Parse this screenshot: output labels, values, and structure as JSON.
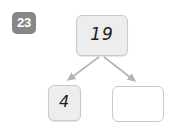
{
  "exercise": {
    "type": "number-bond",
    "question_number": "23",
    "whole": {
      "value": "19",
      "filled": true
    },
    "parts": [
      {
        "name": "left-part",
        "value": "4",
        "filled": true
      },
      {
        "name": "right-part",
        "value": "",
        "filled": false,
        "placeholder": ""
      }
    ],
    "arrows": [
      {
        "name": "arrow-to-left-part",
        "from": "whole",
        "to": "left-part"
      },
      {
        "name": "arrow-to-right-part",
        "from": "whole",
        "to": "right-part"
      }
    ],
    "colors": {
      "badge_background": "#878787",
      "badge_text": "#ffffff",
      "box_fill": "#ededed",
      "box_empty_fill": "#ffffff",
      "box_border": "#c9c9c9",
      "arrow": "#b4b4b4",
      "value_text": "#1d1d1d",
      "page_background": "#ffffff"
    }
  }
}
